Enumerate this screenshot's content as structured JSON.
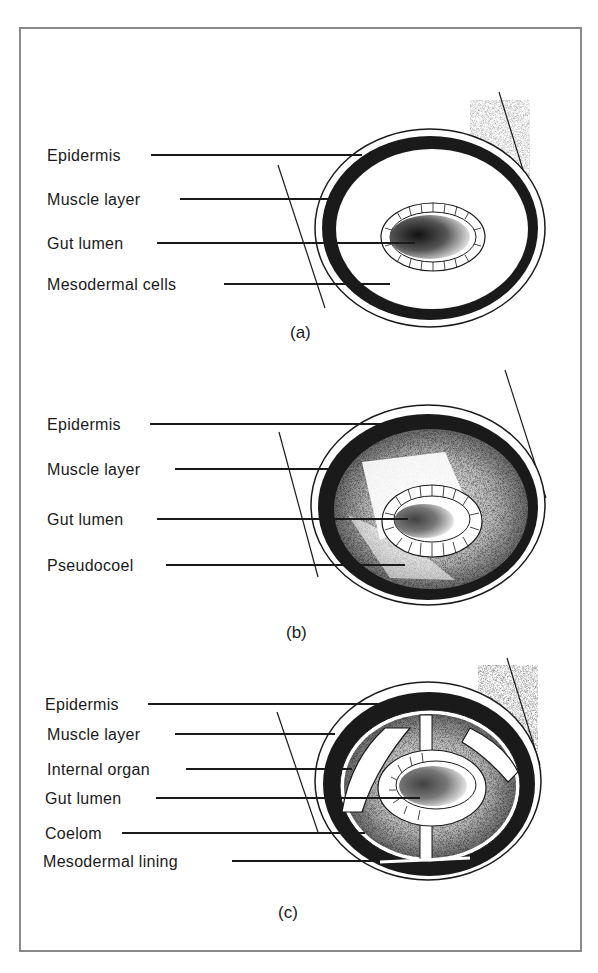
{
  "figure": {
    "panels": [
      {
        "id": "a",
        "caption": "(a)",
        "type": "acoelomate",
        "labels": [
          "Epidermis",
          "Muscle layer",
          "Gut lumen",
          "Mesodermal cells"
        ]
      },
      {
        "id": "b",
        "caption": "(b)",
        "type": "pseudocoelomate",
        "labels": [
          "Epidermis",
          "Muscle layer",
          "Gut lumen",
          "Pseudocoel"
        ]
      },
      {
        "id": "c",
        "caption": "(c)",
        "type": "coelomate",
        "labels": [
          "Epidermis",
          "Muscle layer",
          "Internal organ",
          "Gut lumen",
          "Coelom",
          "Mesodermal lining"
        ]
      }
    ],
    "colors": {
      "ink": "#1a1a1a",
      "frame": "#8a8a8a",
      "background": "#ffffff"
    }
  }
}
